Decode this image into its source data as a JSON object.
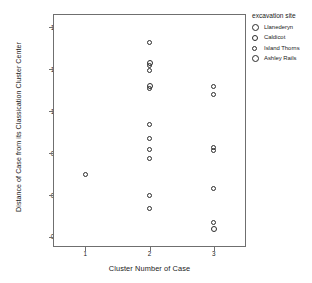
{
  "chart_data": {
    "type": "scatter",
    "title": "",
    "xlabel": "Cluster Number of Case",
    "ylabel": "Distance of Case from its Classication Cluster Center",
    "xlim": [
      0.5,
      3.5
    ],
    "ylim": [
      0.19,
      1.58
    ],
    "xticks": [
      "1",
      "2",
      "3"
    ],
    "xtick_values": [
      1,
      2,
      3
    ],
    "yticks": [
      "0.25",
      "0.50",
      "0.75",
      "1.00",
      "1.25",
      "1.50"
    ],
    "ytick_values": [
      0.25,
      0.5,
      0.75,
      1.0,
      1.25,
      1.5
    ],
    "grid": false,
    "legend_position": "top-right",
    "legend_title": "excavation site",
    "marker": "open-circle",
    "marker_color": "#2b2b2b",
    "points": [
      {
        "x": 1,
        "y": 0.62,
        "size": 5
      },
      {
        "x": 2,
        "y": 1.41,
        "size": 5
      },
      {
        "x": 2,
        "y": 1.29,
        "size": 6
      },
      {
        "x": 2,
        "y": 1.275,
        "size": 5
      },
      {
        "x": 2,
        "y": 1.24,
        "size": 5
      },
      {
        "x": 2,
        "y": 1.15,
        "size": 6
      },
      {
        "x": 2,
        "y": 1.135,
        "size": 5
      },
      {
        "x": 2,
        "y": 0.92,
        "size": 5
      },
      {
        "x": 2,
        "y": 0.84,
        "size": 5
      },
      {
        "x": 2,
        "y": 0.77,
        "size": 5
      },
      {
        "x": 2,
        "y": 0.72,
        "size": 5
      },
      {
        "x": 2,
        "y": 0.5,
        "size": 5
      },
      {
        "x": 2,
        "y": 0.42,
        "size": 5
      },
      {
        "x": 3,
        "y": 1.15,
        "size": 5
      },
      {
        "x": 3,
        "y": 1.1,
        "size": 5
      },
      {
        "x": 3,
        "y": 0.785,
        "size": 5
      },
      {
        "x": 3,
        "y": 0.765,
        "size": 5
      },
      {
        "x": 3,
        "y": 0.54,
        "size": 5
      },
      {
        "x": 3,
        "y": 0.335,
        "size": 5
      },
      {
        "x": 3,
        "y": 0.3,
        "size": 6
      }
    ],
    "legend_entries": [
      {
        "label": "Llanederyn",
        "marker_size": 7
      },
      {
        "label": "Caldicot",
        "marker_size": 6
      },
      {
        "label": "Island Thorns",
        "marker_size": 5
      },
      {
        "label": "Ashley Rails",
        "marker_size": 7
      }
    ]
  }
}
